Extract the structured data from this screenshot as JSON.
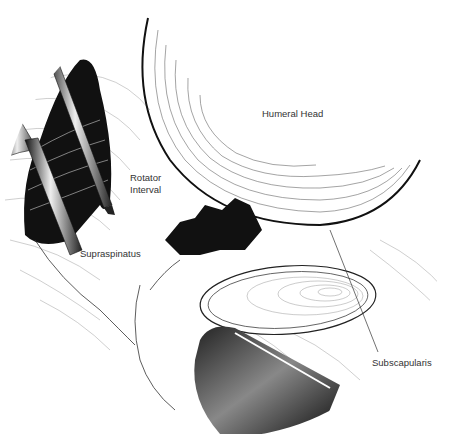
{
  "figure": {
    "labels": {
      "humeral_head": "Humeral Head",
      "rotator_interval_line1": "Rotator",
      "rotator_interval_line2": "Interval",
      "supraspinatus": "Supraspinatus",
      "subscapularis": "Subscapularis"
    },
    "colors": {
      "ink": "#111111",
      "hatch": "#555555",
      "label": "#333333",
      "background": "#ffffff"
    }
  }
}
